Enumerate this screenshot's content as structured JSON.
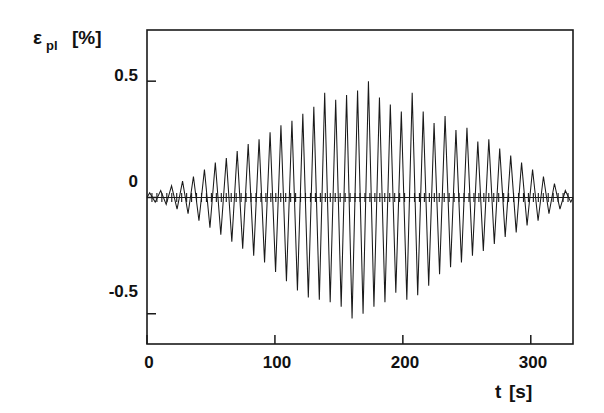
{
  "chart_data": {
    "type": "line",
    "title": "",
    "subtitle": "",
    "xlabel": "t [s]",
    "ylabel": "ε_pl [%]",
    "ylabel_main": "ε",
    "ylabel_subscript": "pl",
    "ylabel_unit": "[%]",
    "xlabel_main": "t",
    "xlabel_unit": "[s]",
    "xlim": [
      0,
      333
    ],
    "ylim": [
      -0.63,
      0.72
    ],
    "xticks": [
      0,
      100,
      200,
      300
    ],
    "xticklabels": [
      "0",
      "100",
      "200",
      "300"
    ],
    "yticks": [
      0.5,
      0,
      -0.5
    ],
    "yticklabels": [
      "0.5",
      "0",
      "-0.5"
    ],
    "grid": false,
    "legend": null,
    "series_name": "plastic strain amplitude",
    "zero_line": true,
    "zero_line_ticks": true,
    "cycle_period_s": 8.55,
    "n_cycles": 39,
    "amplitude_envelope": {
      "peak_time_s": 170,
      "peak_value_pct": 0.5,
      "min_value_pct": -0.52
    },
    "peaks": [
      {
        "t": 2.1,
        "y": 0.02
      },
      {
        "t": 6.4,
        "y": -0.02
      },
      {
        "t": 10.7,
        "y": 0.03
      },
      {
        "t": 15.0,
        "y": -0.03
      },
      {
        "t": 19.2,
        "y": 0.05
      },
      {
        "t": 23.5,
        "y": -0.05
      },
      {
        "t": 27.8,
        "y": 0.07
      },
      {
        "t": 32.1,
        "y": -0.07
      },
      {
        "t": 36.3,
        "y": 0.09
      },
      {
        "t": 40.6,
        "y": -0.1
      },
      {
        "t": 44.9,
        "y": 0.12
      },
      {
        "t": 49.2,
        "y": -0.13
      },
      {
        "t": 53.4,
        "y": 0.15
      },
      {
        "t": 57.7,
        "y": -0.16
      },
      {
        "t": 62.0,
        "y": 0.17
      },
      {
        "t": 66.3,
        "y": -0.19
      },
      {
        "t": 70.5,
        "y": 0.2
      },
      {
        "t": 74.8,
        "y": -0.22
      },
      {
        "t": 79.1,
        "y": 0.23
      },
      {
        "t": 83.4,
        "y": -0.25
      },
      {
        "t": 87.6,
        "y": 0.25
      },
      {
        "t": 91.9,
        "y": -0.28
      },
      {
        "t": 96.2,
        "y": 0.28
      },
      {
        "t": 100.5,
        "y": -0.32
      },
      {
        "t": 104.7,
        "y": 0.31
      },
      {
        "t": 109.0,
        "y": -0.36
      },
      {
        "t": 113.3,
        "y": 0.33
      },
      {
        "t": 117.6,
        "y": -0.4
      },
      {
        "t": 121.8,
        "y": 0.36
      },
      {
        "t": 126.1,
        "y": -0.43
      },
      {
        "t": 130.4,
        "y": 0.39
      },
      {
        "t": 134.7,
        "y": -0.44
      },
      {
        "t": 138.9,
        "y": 0.45
      },
      {
        "t": 143.2,
        "y": -0.45
      },
      {
        "t": 147.5,
        "y": 0.42
      },
      {
        "t": 151.8,
        "y": -0.47
      },
      {
        "t": 156.0,
        "y": 0.44
      },
      {
        "t": 160.3,
        "y": -0.52
      },
      {
        "t": 164.6,
        "y": 0.46
      },
      {
        "t": 168.9,
        "y": -0.5
      },
      {
        "t": 173.1,
        "y": 0.5
      },
      {
        "t": 177.4,
        "y": -0.47
      },
      {
        "t": 181.7,
        "y": 0.43
      },
      {
        "t": 186.0,
        "y": -0.45
      },
      {
        "t": 190.2,
        "y": 0.4
      },
      {
        "t": 194.5,
        "y": -0.41
      },
      {
        "t": 198.8,
        "y": 0.37
      },
      {
        "t": 203.1,
        "y": -0.44
      },
      {
        "t": 207.3,
        "y": 0.45
      },
      {
        "t": 211.6,
        "y": -0.42
      },
      {
        "t": 215.9,
        "y": 0.37
      },
      {
        "t": 220.2,
        "y": -0.38
      },
      {
        "t": 224.4,
        "y": 0.32
      },
      {
        "t": 228.7,
        "y": -0.33
      },
      {
        "t": 233.0,
        "y": 0.35
      },
      {
        "t": 237.3,
        "y": -0.3
      },
      {
        "t": 241.5,
        "y": 0.29
      },
      {
        "t": 245.8,
        "y": -0.28
      },
      {
        "t": 250.1,
        "y": 0.3
      },
      {
        "t": 254.4,
        "y": -0.25
      },
      {
        "t": 258.6,
        "y": 0.24
      },
      {
        "t": 262.9,
        "y": -0.23
      },
      {
        "t": 267.2,
        "y": 0.25
      },
      {
        "t": 271.5,
        "y": -0.2
      },
      {
        "t": 275.7,
        "y": 0.21
      },
      {
        "t": 280.0,
        "y": -0.17
      },
      {
        "t": 284.3,
        "y": 0.18
      },
      {
        "t": 288.6,
        "y": -0.15
      },
      {
        "t": 292.8,
        "y": 0.15
      },
      {
        "t": 297.1,
        "y": -0.12
      },
      {
        "t": 301.4,
        "y": 0.12
      },
      {
        "t": 305.7,
        "y": -0.1
      },
      {
        "t": 309.9,
        "y": 0.09
      },
      {
        "t": 314.2,
        "y": -0.07
      },
      {
        "t": 318.5,
        "y": 0.06
      },
      {
        "t": 322.8,
        "y": -0.05
      },
      {
        "t": 327.0,
        "y": 0.03
      },
      {
        "t": 331.3,
        "y": -0.02
      }
    ]
  },
  "figure": {
    "plot_area": {
      "left": 147,
      "top": 30,
      "right": 573,
      "bottom": 344
    },
    "background_color": "#ffffff",
    "line_color": "#1a1a1a"
  }
}
